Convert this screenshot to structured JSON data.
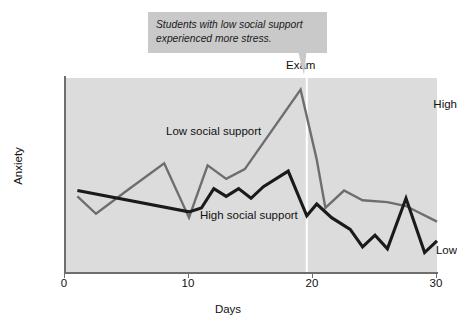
{
  "callout": {
    "line1": "Students with low social support",
    "line2": "experienced more stress."
  },
  "annotations": {
    "exam": "Exam"
  },
  "chart_data": {
    "type": "line",
    "title": "",
    "xlabel": "Days",
    "ylabel": "Anxiety",
    "xlim": [
      0,
      30
    ],
    "xticks": [
      0,
      10,
      20,
      30
    ],
    "xticklabels": [
      "0",
      "10",
      "20",
      "30"
    ],
    "ylim": [
      0,
      1
    ],
    "yticklabels": [
      "Low",
      "High"
    ],
    "ytick_positions": [
      0.12,
      0.88
    ],
    "grid": false,
    "legend": "inline-labels",
    "plot_background": "#dcdcdc",
    "callout_background": "#c9c9c9",
    "annotation_line": {
      "label": "Exam",
      "x": 19.5,
      "color": "#ffffff"
    },
    "series": [
      {
        "name": "Low social support",
        "color": "#6e6e6e",
        "x": [
          1,
          2.5,
          5,
          8,
          10,
          11.5,
          13,
          14.5,
          19,
          20.3,
          21,
          22.5,
          24,
          26,
          27.5,
          30
        ],
        "y": [
          0.39,
          0.3,
          0.42,
          0.56,
          0.28,
          0.55,
          0.48,
          0.53,
          0.94,
          0.58,
          0.33,
          0.42,
          0.37,
          0.36,
          0.34,
          0.26
        ]
      },
      {
        "name": "High social support",
        "color": "#1a1a1a",
        "x": [
          1,
          10,
          11,
          12,
          13,
          14,
          15,
          16,
          18,
          19.5,
          20.3,
          21.5,
          23,
          24,
          25,
          26,
          27.5,
          29,
          30
        ],
        "y": [
          0.42,
          0.31,
          0.33,
          0.43,
          0.39,
          0.43,
          0.38,
          0.44,
          0.52,
          0.29,
          0.35,
          0.28,
          0.22,
          0.13,
          0.19,
          0.12,
          0.38,
          0.1,
          0.16
        ]
      }
    ]
  }
}
